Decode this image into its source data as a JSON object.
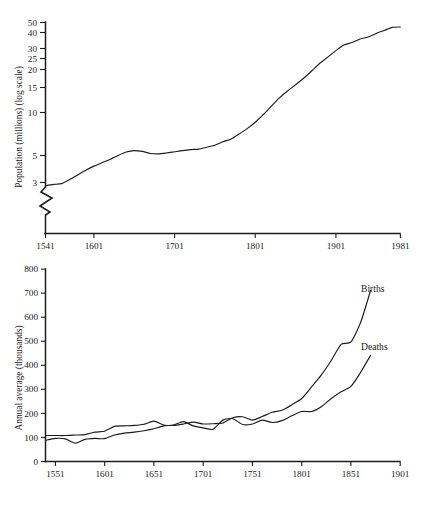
{
  "figure": {
    "background": "#ffffff",
    "ink_color": "#1c1c1c"
  },
  "chart_data": [
    {
      "id": "population-chart",
      "type": "line",
      "title": "",
      "subtitle": "",
      "xlabel": "",
      "ylabel": "Population (millions) (log scale)",
      "yscale": "log",
      "ylim": [
        2.6,
        52
      ],
      "xlim": [
        1541,
        1981
      ],
      "grid": false,
      "legend_position": "none",
      "axis_break": true,
      "ytick_labels": [
        "50",
        "40",
        "30",
        "25",
        "20",
        "15",
        "10",
        "5",
        "3"
      ],
      "ytick_values": [
        50,
        40,
        30,
        25,
        20,
        15,
        10,
        5,
        3
      ],
      "xtick_labels": [
        "1541",
        "1601",
        "1701",
        "1801",
        "1901",
        "1981"
      ],
      "xtick_values": [
        1541,
        1601,
        1701,
        1801,
        1901,
        1981
      ],
      "series": [
        {
          "name": "Population",
          "x": [
            1541,
            1551,
            1561,
            1571,
            1581,
            1591,
            1601,
            1611,
            1621,
            1631,
            1641,
            1651,
            1661,
            1671,
            1681,
            1691,
            1701,
            1711,
            1721,
            1731,
            1741,
            1751,
            1761,
            1771,
            1781,
            1791,
            1801,
            1811,
            1821,
            1831,
            1841,
            1851,
            1861,
            1871,
            1881,
            1891,
            1901,
            1911,
            1921,
            1931,
            1941,
            1951,
            1961,
            1971,
            1981
          ],
          "values": [
            2.83,
            2.9,
            2.94,
            3.16,
            3.43,
            3.72,
            4.0,
            4.25,
            4.5,
            4.83,
            5.13,
            5.26,
            5.18,
            5.0,
            4.96,
            5.04,
            5.15,
            5.26,
            5.35,
            5.4,
            5.58,
            5.77,
            6.15,
            6.45,
            7.04,
            7.74,
            8.66,
            9.89,
            11.49,
            13.28,
            15.0,
            16.74,
            18.78,
            21.3,
            24.4,
            27.2,
            30.5,
            33.6,
            35.2,
            37.4,
            38.8,
            41.2,
            43.5,
            45.9,
            46.2
          ],
          "style": "solid"
        }
      ]
    },
    {
      "id": "births-deaths-chart",
      "type": "line",
      "title": "",
      "subtitle": "",
      "xlabel": "",
      "ylabel": "Annual average (thousands)",
      "yscale": "linear",
      "ylim": [
        0,
        800
      ],
      "xlim": [
        1541,
        1901
      ],
      "grid": false,
      "legend_position": "inline-right",
      "ytick_labels": [
        "0",
        "100",
        "200",
        "300",
        "400",
        "500",
        "600",
        "700",
        "800"
      ],
      "ytick_values": [
        0,
        100,
        200,
        300,
        400,
        500,
        600,
        700,
        800
      ],
      "xtick_labels": [
        "1551",
        "1601",
        "1651",
        "1701",
        "1751",
        "1801",
        "1851",
        "1901"
      ],
      "xtick_values": [
        1551,
        1601,
        1651,
        1701,
        1751,
        1801,
        1851,
        1901
      ],
      "series": [
        {
          "name": "Births",
          "label": "Births",
          "style": "solid",
          "x": [
            1541,
            1551,
            1561,
            1571,
            1581,
            1591,
            1601,
            1611,
            1621,
            1631,
            1641,
            1651,
            1661,
            1671,
            1681,
            1691,
            1701,
            1711,
            1721,
            1731,
            1741,
            1751,
            1761,
            1771,
            1781,
            1791,
            1801,
            1811,
            1821,
            1831,
            1841,
            1851,
            1861,
            1871
          ],
          "values": [
            108,
            108,
            108,
            110,
            112,
            122,
            126,
            146,
            148,
            150,
            155,
            168,
            152,
            150,
            156,
            164,
            156,
            157,
            160,
            182,
            186,
            172,
            187,
            205,
            213,
            236,
            262,
            310,
            360,
            420,
            487,
            497,
            580,
            712
          ]
        },
        {
          "name": "Deaths",
          "label": "Deaths",
          "style": "solid",
          "x": [
            1541,
            1551,
            1561,
            1571,
            1581,
            1591,
            1601,
            1611,
            1621,
            1631,
            1641,
            1651,
            1661,
            1671,
            1681,
            1691,
            1701,
            1711,
            1721,
            1731,
            1741,
            1751,
            1761,
            1771,
            1781,
            1791,
            1801,
            1811,
            1821,
            1831,
            1841,
            1851,
            1861,
            1871
          ],
          "values": [
            88,
            96,
            94,
            76,
            92,
            96,
            95,
            110,
            118,
            122,
            128,
            136,
            148,
            152,
            166,
            148,
            140,
            134,
            172,
            178,
            154,
            156,
            172,
            162,
            170,
            190,
            208,
            208,
            228,
            262,
            290,
            312,
            372,
            442
          ]
        }
      ]
    }
  ]
}
